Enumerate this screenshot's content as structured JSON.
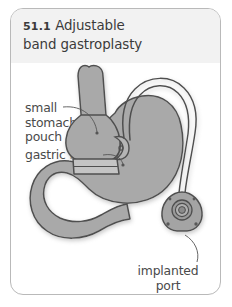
{
  "figure": {
    "number": "51.1",
    "title_line1": "Adjustable",
    "title_line2": "band gastroplasty",
    "title_full": "51.1  Adjustable band gastroplasty"
  },
  "callouts": [
    {
      "id": "small-stomach-pouch",
      "text": "small\nstomach\npouch"
    },
    {
      "id": "gastric-band",
      "text": "gastric band"
    },
    {
      "id": "implanted-port",
      "text": "implanted\nport"
    }
  ],
  "anatomy": [
    {
      "id": "esophagus",
      "label": "esophagus"
    },
    {
      "id": "stomach-pouch",
      "label": "small stomach pouch"
    },
    {
      "id": "stomach-body",
      "label": "stomach body"
    },
    {
      "id": "duodenum",
      "label": "duodenum"
    },
    {
      "id": "gastric-band",
      "label": "adjustable gastric band"
    },
    {
      "id": "connecting-tubing",
      "label": "connecting tubing"
    },
    {
      "id": "access-port",
      "label": "implanted access port"
    }
  ],
  "colors": {
    "page_background": "#ffffff",
    "frame_border": "#b9b9b9",
    "title_band": "#f2f2f2",
    "title_text": "#3b3b3b",
    "callout_text": "#4a4a4a",
    "organ_fill": "#a9a9a9",
    "organ_outline": "#4f4f4f",
    "band_fill": "#c9c9c9",
    "tubing_stroke": "#4f4f4f",
    "port_fill": "#9f9f9f",
    "leader_line": "#555555",
    "shadow": "#d8d8d8"
  }
}
